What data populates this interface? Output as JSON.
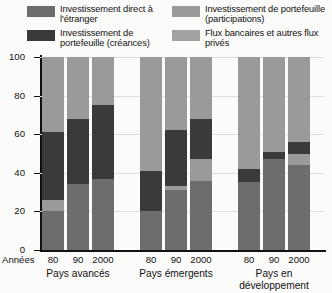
{
  "chart_data": {
    "type": "bar",
    "subtype": "stacked-100-percent",
    "title": "",
    "xlabel": "Années",
    "ylabel": "",
    "ylim": [
      0,
      100
    ],
    "yticks": [
      0,
      20,
      40,
      60,
      80,
      100
    ],
    "grid": true,
    "legend_position": "top",
    "groups": [
      {
        "name": "Pays avancés",
        "categories": [
          "80",
          "90",
          "2000"
        ]
      },
      {
        "name": "Pays émergents",
        "categories": [
          "80",
          "90",
          "2000"
        ]
      },
      {
        "name": "Pays en\ndéveloppement",
        "categories": [
          "80",
          "90",
          "2000"
        ]
      }
    ],
    "categories": [
      "80",
      "90",
      "2000",
      "80",
      "90",
      "2000",
      "80",
      "90",
      "2000"
    ],
    "series": [
      {
        "name": "Investissement direct à l'étranger",
        "key": "ide",
        "color": "#6d6d6d",
        "values": [
          20,
          34,
          37,
          20,
          31,
          36,
          35,
          47,
          44
        ]
      },
      {
        "name": "Investissement de portefeuille (participations)",
        "key": "portefeuille_participations",
        "color": "#9a9a9a",
        "values": [
          6,
          0,
          0,
          0,
          2,
          11,
          0,
          0,
          6
        ]
      },
      {
        "name": "Investissement de portefeuille (créances)",
        "key": "portefeuille_creances",
        "color": "#3a3a3a",
        "values": [
          35,
          34,
          38,
          21,
          29,
          21,
          7,
          4,
          6
        ]
      },
      {
        "name": "Flux bancaires et autres flux privés",
        "key": "flux_bancaires",
        "color": "#9a9a9a",
        "values": [
          39,
          32,
          25,
          59,
          38,
          32,
          58,
          49,
          44
        ]
      }
    ]
  },
  "legend": {
    "items": [
      {
        "label": "Investissement direct à l'étranger",
        "color": "#6d6d6d",
        "column": "left"
      },
      {
        "label": "Investissement de portefeuille (créances)",
        "color": "#3a3a3a",
        "column": "left"
      },
      {
        "label": "Investissement de portefeuille (participations)",
        "color": "#9a9a9a",
        "column": "right"
      },
      {
        "label": "Flux bancaires et autres flux privés",
        "color": "#a2a2a2",
        "column": "right"
      }
    ]
  },
  "axis": {
    "y_labels": [
      "100",
      "80",
      "60",
      "40",
      "20",
      "0"
    ],
    "x_origin_label": "Années",
    "x_tick_labels": [
      "80",
      "90",
      "2000",
      "80",
      "90",
      "2000",
      "80",
      "90",
      "2000"
    ],
    "group_labels": [
      "Pays avancés",
      "Pays émergents",
      "Pays en développement"
    ]
  },
  "colors": {
    "ide": "#6d6d6d",
    "creances": "#3a3a3a",
    "participations": "#9a9a9a",
    "bancaires": "#a2a2a2",
    "background": "#fbfbfa",
    "axis": "#111111",
    "grid": "#dedede"
  }
}
